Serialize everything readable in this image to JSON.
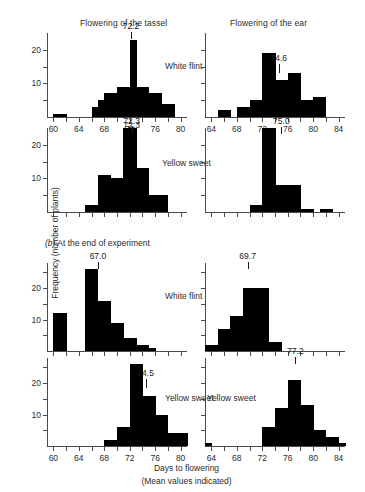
{
  "figure": {
    "column_titles": [
      {
        "label": "Flowering of the tassel"
      },
      {
        "label": "Flowering of the ear"
      }
    ],
    "y_axis_title": "Frequency (number of plants)",
    "x_axis_title": "Days to flowering",
    "x_axis_subtitle": "(Mean values indicated)",
    "section_b_caption_marker": "(b)",
    "section_b_caption_text": "At the end of experiment"
  },
  "chart_data": [
    {
      "type": "bar",
      "title": "Flowering of the tassel",
      "variety": "White flint",
      "panel": "top-left",
      "mean": 72.2,
      "mean_label": "72.2",
      "secondary_mean_label": "72.3",
      "xlabel": "Days to flowering",
      "ylabel": "Frequency (number of plants)",
      "xlim": [
        59,
        81
      ],
      "ylim": [
        0,
        25
      ],
      "bin_width": 1,
      "yticks": [
        5,
        10,
        15,
        20
      ],
      "ytick_labels": [
        "",
        "10",
        "",
        "20"
      ],
      "xticks": [
        60,
        62,
        64,
        66,
        68,
        70,
        72,
        74,
        76,
        78,
        80
      ],
      "xtick_labels": [
        "60",
        "",
        "64",
        "",
        "68",
        "",
        "72",
        "",
        "76",
        "",
        "80"
      ],
      "categories": [
        59,
        60,
        61,
        62,
        63,
        64,
        65,
        66,
        67,
        68,
        69,
        70,
        71,
        72,
        73,
        74,
        75,
        76,
        77,
        78,
        79,
        80
      ],
      "values": [
        0,
        1,
        1,
        0,
        0,
        0,
        0,
        3,
        5,
        7,
        7,
        9,
        9,
        23,
        9,
        9,
        7,
        7,
        4,
        4,
        0,
        0
      ]
    },
    {
      "type": "bar",
      "title": "Flowering of the ear",
      "variety": "White flint",
      "panel": "top-right",
      "mean": 74.6,
      "mean_label": "74.6",
      "xlim": [
        63,
        85
      ],
      "ylim": [
        0,
        25
      ],
      "bin_width": 1,
      "yticks": [
        5,
        10,
        15,
        20
      ],
      "ytick_labels": [
        "",
        "",
        "",
        ""
      ],
      "xticks": [
        64,
        66,
        68,
        70,
        72,
        74,
        76,
        78,
        80,
        82,
        84
      ],
      "xtick_labels": [
        "64",
        "",
        "68",
        "",
        "72",
        "",
        "76",
        "",
        "80",
        "",
        "84"
      ],
      "categories": [
        63,
        64,
        65,
        66,
        67,
        68,
        69,
        70,
        71,
        72,
        73,
        74,
        75,
        76,
        77,
        78,
        79,
        80,
        81,
        82,
        83,
        84
      ],
      "values": [
        0,
        0,
        2,
        2,
        0,
        3,
        3,
        5,
        5,
        19,
        19,
        11,
        11,
        13,
        13,
        5,
        5,
        6,
        6,
        0,
        0,
        0
      ]
    },
    {
      "type": "bar",
      "title": "Flowering of the tassel",
      "variety": "Yellow sweet",
      "panel": "second-left",
      "mean": 72.3,
      "mean_label": "72.3",
      "xlim": [
        59,
        81
      ],
      "ylim": [
        0,
        25
      ],
      "bin_width": 1,
      "yticks": [
        5,
        10,
        15,
        20
      ],
      "ytick_labels": [
        "",
        "10",
        "",
        "20"
      ],
      "xticks": [
        60,
        62,
        64,
        66,
        68,
        70,
        72,
        74,
        76,
        78,
        80
      ],
      "xtick_labels": [
        "",
        "",
        "",
        "",
        "",
        "",
        "",
        "",
        "",
        "",
        ""
      ],
      "categories": [
        59,
        60,
        61,
        62,
        63,
        64,
        65,
        66,
        67,
        68,
        69,
        70,
        71,
        72,
        73,
        74,
        75,
        76,
        77,
        78,
        79,
        80
      ],
      "values": [
        0,
        0,
        0,
        0,
        0,
        0,
        2,
        2,
        11,
        11,
        10,
        10,
        25,
        25,
        13,
        13,
        5,
        5,
        5,
        0,
        0,
        0
      ]
    },
    {
      "type": "bar",
      "title": "Flowering of the ear",
      "variety": "Yellow sweet",
      "panel": "second-right",
      "mean": 75.0,
      "mean_label": "75.0",
      "xlim": [
        63,
        85
      ],
      "ylim": [
        0,
        25
      ],
      "bin_width": 1,
      "yticks": [
        5,
        10,
        15,
        20
      ],
      "ytick_labels": [
        "",
        "",
        "",
        ""
      ],
      "xticks": [
        64,
        66,
        68,
        70,
        72,
        74,
        76,
        78,
        80,
        82,
        84
      ],
      "xtick_labels": [
        "",
        "",
        "",
        "",
        "",
        "",
        "",
        "",
        "",
        "",
        ""
      ],
      "categories": [
        63,
        64,
        65,
        66,
        67,
        68,
        69,
        70,
        71,
        72,
        73,
        74,
        75,
        76,
        77,
        78,
        79,
        80,
        81,
        82,
        83,
        84
      ],
      "values": [
        0,
        0,
        0,
        0,
        0,
        0,
        0,
        2,
        2,
        25,
        25,
        8,
        8,
        8,
        8,
        1,
        1,
        0,
        1,
        1,
        0,
        0
      ]
    },
    {
      "type": "bar",
      "title": "Flowering of the tassel",
      "variety": "White flint",
      "panel": "third-left",
      "mean": 67.0,
      "mean_label": "67.0",
      "xlim": [
        59,
        81
      ],
      "ylim": [
        0,
        28
      ],
      "bin_width": 1,
      "yticks": [
        5,
        10,
        15,
        20,
        25
      ],
      "ytick_labels": [
        "",
        "10",
        "",
        "20",
        ""
      ],
      "xticks": [
        60,
        62,
        64,
        66,
        68,
        70,
        72,
        74,
        76,
        78,
        80
      ],
      "xtick_labels": [
        "",
        "",
        "",
        "",
        "",
        "",
        "",
        "",
        "",
        "",
        ""
      ],
      "categories": [
        59,
        60,
        61,
        62,
        63,
        64,
        65,
        66,
        67,
        68,
        69,
        70,
        71,
        72,
        73,
        74,
        75,
        76,
        77,
        78,
        79,
        80
      ],
      "values": [
        0,
        12,
        12,
        0,
        0,
        0,
        26,
        26,
        16,
        16,
        9,
        9,
        4,
        4,
        2,
        2,
        1,
        0,
        0,
        0,
        0,
        0
      ]
    },
    {
      "type": "bar",
      "title": "Flowering of the ear",
      "variety": "White flint",
      "panel": "third-right",
      "mean": 69.7,
      "mean_label": "69.7",
      "xlim": [
        63,
        85
      ],
      "ylim": [
        0,
        28
      ],
      "bin_width": 1,
      "yticks": [
        5,
        10,
        15,
        20,
        25
      ],
      "ytick_labels": [
        "",
        "",
        "",
        "",
        ""
      ],
      "xticks": [
        64,
        66,
        68,
        70,
        72,
        74,
        76,
        78,
        80,
        82,
        84
      ],
      "xtick_labels": [
        "",
        "",
        "",
        "",
        "",
        "",
        "",
        "",
        "",
        "",
        ""
      ],
      "categories": [
        63,
        64,
        65,
        66,
        67,
        68,
        69,
        70,
        71,
        72,
        73,
        74,
        75,
        76,
        77,
        78,
        79,
        80,
        81,
        82,
        83,
        84
      ],
      "values": [
        2,
        2,
        7,
        7,
        11,
        11,
        20,
        20,
        20,
        20,
        3,
        3,
        0,
        0,
        0,
        0,
        0,
        0,
        0,
        0,
        0,
        0
      ]
    },
    {
      "type": "bar",
      "title": "Flowering of the tassel",
      "variety": "Yellow sweet",
      "panel": "bottom-left",
      "mean": 74.5,
      "mean_label": "74.5",
      "xlim": [
        59,
        81
      ],
      "ylim": [
        0,
        28
      ],
      "bin_width": 1,
      "yticks": [
        5,
        10,
        15,
        20,
        25
      ],
      "ytick_labels": [
        "",
        "10",
        "",
        "20",
        ""
      ],
      "xticks": [
        60,
        62,
        64,
        66,
        68,
        70,
        72,
        74,
        76,
        78,
        80
      ],
      "xtick_labels": [
        "60",
        "",
        "64",
        "",
        "68",
        "",
        "72",
        "",
        "76",
        "",
        "80"
      ],
      "categories": [
        59,
        60,
        61,
        62,
        63,
        64,
        65,
        66,
        67,
        68,
        69,
        70,
        71,
        72,
        73,
        74,
        75,
        76,
        77,
        78,
        79,
        80
      ],
      "values": [
        0,
        0,
        0,
        0,
        0,
        0,
        0,
        0,
        0,
        2,
        2,
        6,
        6,
        26,
        26,
        16,
        16,
        10,
        10,
        4,
        4,
        4
      ]
    },
    {
      "type": "bar",
      "title": "Flowering of the ear",
      "variety": "Yellow sweet",
      "panel": "bottom-right",
      "mean": 77.2,
      "mean_label": "77.2",
      "xlim": [
        63,
        85
      ],
      "ylim": [
        0,
        28
      ],
      "bin_width": 1,
      "yticks": [
        5,
        10,
        15,
        20,
        25
      ],
      "ytick_labels": [
        "",
        "",
        "",
        "",
        ""
      ],
      "xticks": [
        64,
        66,
        68,
        70,
        72,
        74,
        76,
        78,
        80,
        82,
        84
      ],
      "xtick_labels": [
        "64",
        "",
        "68",
        "",
        "72",
        "",
        "76",
        "",
        "80",
        "",
        "84"
      ],
      "categories": [
        63,
        64,
        65,
        66,
        67,
        68,
        69,
        70,
        71,
        72,
        73,
        74,
        75,
        76,
        77,
        78,
        79,
        80,
        81,
        82,
        83,
        84
      ],
      "values": [
        1,
        0,
        0,
        0,
        0,
        0,
        0,
        0,
        0,
        6,
        6,
        12,
        12,
        21,
        21,
        13,
        13,
        5,
        5,
        3,
        3,
        1
      ]
    }
  ]
}
